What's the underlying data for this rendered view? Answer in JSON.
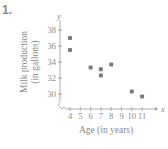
{
  "problem_number": "1.",
  "chart_data": {
    "type": "scatter",
    "title": "",
    "xlabel": "Age (in years)",
    "ylabel": "Milk production (in gallons)",
    "ylabel_lines": [
      "Milk production",
      "(in gallons)"
    ],
    "x_axis_letter": "x",
    "y_axis_letter": "y",
    "x_ticks": [
      4,
      5,
      6,
      7,
      8,
      9,
      10,
      11
    ],
    "y_ticks": [
      30,
      32,
      34,
      36,
      38
    ],
    "xlim": [
      3,
      12
    ],
    "ylim": [
      28,
      40
    ],
    "axis_break": true,
    "grid": false,
    "point_color": "#7a7a7a",
    "points": [
      {
        "x": 4,
        "y": 37.0
      },
      {
        "x": 4,
        "y": 35.5
      },
      {
        "x": 6,
        "y": 33.3
      },
      {
        "x": 7,
        "y": 33.1
      },
      {
        "x": 7,
        "y": 32.3
      },
      {
        "x": 8,
        "y": 33.7
      },
      {
        "x": 10,
        "y": 30.3
      },
      {
        "x": 11,
        "y": 29.7
      }
    ]
  }
}
